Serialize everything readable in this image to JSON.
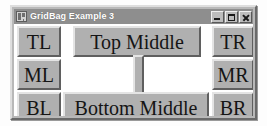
{
  "window": {
    "title": "GridBag Example 3",
    "icon": "java-window-icon",
    "controls": {
      "minimize": {
        "name": "minimize-button",
        "glyph": "minimize-icon",
        "label": "_"
      },
      "maximize": {
        "name": "maximize-button",
        "glyph": "maximize-icon",
        "label": "□"
      },
      "close": {
        "name": "close-button",
        "glyph": "close-icon",
        "label": "×"
      }
    },
    "titlebar_color": "#8e8e8e",
    "titlebar_text_color": "#ffffff",
    "frame_color": "#b8b8b8",
    "content_background": "#ffffff"
  },
  "layout": {
    "manager": "GridBagLayout",
    "rows": 3,
    "columns": 3,
    "button_face_color": "#b0b0b0",
    "button_highlight_color": "#e4e4e4",
    "button_shadow_color": "#5f5f5f"
  },
  "buttons": {
    "top_left": {
      "label": "TL",
      "name": "button-tl"
    },
    "top_middle": {
      "label": "Top Middle",
      "name": "button-top-middle"
    },
    "top_right": {
      "label": "TR",
      "name": "button-tr"
    },
    "middle_left": {
      "label": "ML",
      "name": "button-ml"
    },
    "center": {
      "label": "",
      "name": "button-center"
    },
    "middle_right": {
      "label": "MR",
      "name": "button-mr"
    },
    "bottom_left": {
      "label": "BL",
      "name": "button-bl"
    },
    "bottom_middle": {
      "label": "Bottom Middle",
      "name": "button-bottom-middle"
    },
    "bottom_right": {
      "label": "BR",
      "name": "button-br"
    }
  }
}
